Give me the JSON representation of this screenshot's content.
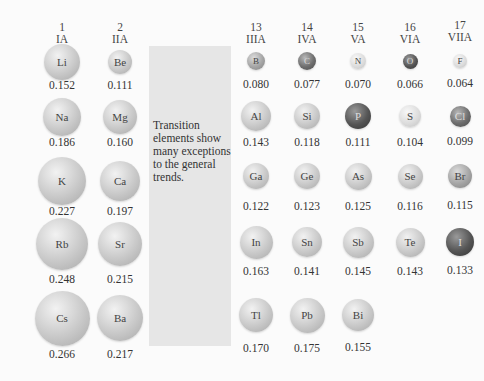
{
  "note": "Transition elements show many exceptions to the general trends.",
  "groups": [
    {
      "num": "1",
      "roman": "IA",
      "x": 62,
      "y": 21
    },
    {
      "num": "2",
      "roman": "IIA",
      "x": 120,
      "y": 21
    },
    {
      "num": "13",
      "roman": "IIIA",
      "x": 256,
      "y": 21
    },
    {
      "num": "14",
      "roman": "IVA",
      "x": 307,
      "y": 21
    },
    {
      "num": "15",
      "roman": "VA",
      "x": 358,
      "y": 21
    },
    {
      "num": "16",
      "roman": "VIA",
      "x": 410,
      "y": 21
    },
    {
      "num": "17",
      "roman": "VIIA",
      "x": 460,
      "y": 19
    }
  ],
  "elements": [
    {
      "symbol": "Li",
      "radius": "0.152",
      "x": 62,
      "y": 62,
      "d": 36,
      "vy": 86,
      "color": "light"
    },
    {
      "symbol": "Be",
      "radius": "0.111",
      "x": 120,
      "y": 62,
      "d": 24,
      "vy": 86,
      "color": "light"
    },
    {
      "symbol": "Na",
      "radius": "0.186",
      "x": 62,
      "y": 117,
      "d": 38,
      "vy": 143,
      "color": "light"
    },
    {
      "symbol": "Mg",
      "radius": "0.160",
      "x": 120,
      "y": 117,
      "d": 34,
      "vy": 143,
      "color": "light"
    },
    {
      "symbol": "K",
      "radius": "0.227",
      "x": 62,
      "y": 181,
      "d": 48,
      "vy": 212,
      "color": "light"
    },
    {
      "symbol": "Ca",
      "radius": "0.197",
      "x": 120,
      "y": 181,
      "d": 40,
      "vy": 212,
      "color": "light"
    },
    {
      "symbol": "Rb",
      "radius": "0.248",
      "x": 62,
      "y": 244,
      "d": 52,
      "vy": 280,
      "color": "light"
    },
    {
      "symbol": "Sr",
      "radius": "0.215",
      "x": 120,
      "y": 244,
      "d": 44,
      "vy": 280,
      "color": "light"
    },
    {
      "symbol": "Cs",
      "radius": "0.266",
      "x": 62,
      "y": 318,
      "d": 55,
      "vy": 355,
      "color": "light"
    },
    {
      "symbol": "Ba",
      "radius": "0.217",
      "x": 120,
      "y": 318,
      "d": 46,
      "vy": 355,
      "color": "light"
    },
    {
      "symbol": "B",
      "radius": "0.080",
      "x": 256,
      "y": 61,
      "d": 18,
      "vy": 85,
      "color": "mid"
    },
    {
      "symbol": "C",
      "radius": "0.077",
      "x": 307,
      "y": 61,
      "d": 18,
      "vy": 85,
      "color": "dark"
    },
    {
      "symbol": "N",
      "radius": "0.070",
      "x": 358,
      "y": 61,
      "d": 16,
      "vy": 85,
      "color": "pale"
    },
    {
      "symbol": "O",
      "radius": "0.066",
      "x": 410,
      "y": 61,
      "d": 15,
      "vy": 85,
      "color": "darker"
    },
    {
      "symbol": "F",
      "radius": "0.064",
      "x": 460,
      "y": 61,
      "d": 14,
      "vy": 84,
      "color": "pale"
    },
    {
      "symbol": "Al",
      "radius": "0.143",
      "x": 256,
      "y": 116,
      "d": 30,
      "vy": 143,
      "color": "light"
    },
    {
      "symbol": "Si",
      "radius": "0.118",
      "x": 307,
      "y": 116,
      "d": 26,
      "vy": 143,
      "color": "light"
    },
    {
      "symbol": "P",
      "radius": "0.111",
      "x": 358,
      "y": 116,
      "d": 26,
      "vy": 143,
      "color": "darker"
    },
    {
      "symbol": "S",
      "radius": "0.104",
      "x": 410,
      "y": 116,
      "d": 22,
      "vy": 143,
      "color": "pale"
    },
    {
      "symbol": "Cl",
      "radius": "0.099",
      "x": 460,
      "y": 116,
      "d": 21,
      "vy": 142,
      "color": "dark"
    },
    {
      "symbol": "Ga",
      "radius": "0.122",
      "x": 256,
      "y": 176,
      "d": 26,
      "vy": 207,
      "color": "light"
    },
    {
      "symbol": "Ge",
      "radius": "0.123",
      "x": 307,
      "y": 176,
      "d": 26,
      "vy": 207,
      "color": "light"
    },
    {
      "symbol": "As",
      "radius": "0.125",
      "x": 358,
      "y": 176,
      "d": 27,
      "vy": 207,
      "color": "light"
    },
    {
      "symbol": "Se",
      "radius": "0.116",
      "x": 410,
      "y": 176,
      "d": 25,
      "vy": 207,
      "color": "light"
    },
    {
      "symbol": "Br",
      "radius": "0.115",
      "x": 460,
      "y": 176,
      "d": 24,
      "vy": 206,
      "color": "mid"
    },
    {
      "symbol": "In",
      "radius": "0.163",
      "x": 256,
      "y": 242,
      "d": 33,
      "vy": 272,
      "color": "light"
    },
    {
      "symbol": "Sn",
      "radius": "0.141",
      "x": 307,
      "y": 242,
      "d": 30,
      "vy": 272,
      "color": "light"
    },
    {
      "symbol": "Sb",
      "radius": "0.145",
      "x": 358,
      "y": 242,
      "d": 31,
      "vy": 272,
      "color": "light"
    },
    {
      "symbol": "Te",
      "radius": "0.143",
      "x": 410,
      "y": 242,
      "d": 29,
      "vy": 272,
      "color": "light"
    },
    {
      "symbol": "I",
      "radius": "0.133",
      "x": 460,
      "y": 242,
      "d": 28,
      "vy": 271,
      "color": "darker"
    },
    {
      "symbol": "Tl",
      "radius": "0.170",
      "x": 256,
      "y": 315,
      "d": 34,
      "vy": 349,
      "color": "light"
    },
    {
      "symbol": "Pb",
      "radius": "0.175",
      "x": 307,
      "y": 315,
      "d": 35,
      "vy": 349,
      "color": "light"
    },
    {
      "symbol": "Bi",
      "radius": "0.155",
      "x": 358,
      "y": 315,
      "d": 32,
      "vy": 348,
      "color": "light"
    }
  ],
  "colors": {
    "light": [
      "#f2f2f2",
      "#c9c9c9",
      "#a8a8a8"
    ],
    "mid": [
      "#dcdcdc",
      "#a5a5a5",
      "#808080"
    ],
    "pale": [
      "#f8f8f8",
      "#dddddd",
      "#c2c2c2"
    ],
    "dark": [
      "#b8b8b8",
      "#6e6e6e",
      "#4a4a4a"
    ],
    "darker": [
      "#9a9a9a",
      "#555555",
      "#333333"
    ]
  },
  "panel_color": "#e6e6e6"
}
